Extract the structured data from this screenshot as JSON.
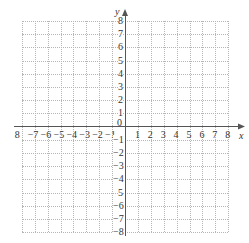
{
  "chart_data": {
    "type": "scatter",
    "title": "",
    "xlabel": "x",
    "ylabel": "y",
    "xlim": [
      -8,
      8
    ],
    "ylim": [
      -8,
      8
    ],
    "grid": true,
    "grid_style": "dotted",
    "series": [],
    "x_tick_labels": [
      "8",
      "−7",
      "−6",
      "−5",
      "−4",
      "−3",
      "−2",
      "−1",
      "0",
      "1",
      "2",
      "3",
      "4",
      "5",
      "6",
      "7",
      "8"
    ],
    "x_tick_values": [
      -8,
      -7,
      -6,
      -5,
      -4,
      -3,
      -2,
      -1,
      0,
      1,
      2,
      3,
      4,
      5,
      6,
      7,
      8
    ],
    "y_tick_labels": [
      "8",
      "7",
      "6",
      "5",
      "4",
      "3",
      "2",
      "1",
      "−1",
      "−2",
      "−3",
      "−4",
      "5",
      "−6",
      "−7",
      "−8"
    ],
    "y_tick_values": [
      8,
      7,
      6,
      5,
      4,
      3,
      2,
      1,
      -1,
      -2,
      -3,
      -4,
      -5,
      -6,
      -7,
      -8
    ],
    "legend": null
  },
  "axes": {
    "x_label": "x",
    "y_label": "y",
    "origin_label": "0"
  },
  "colors": {
    "axis": "#555555",
    "grid": "#b5b5b5",
    "text": "#333333"
  }
}
